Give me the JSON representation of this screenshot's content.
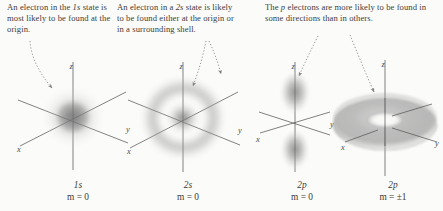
{
  "figure": {
    "background_color": "#fbfbf9",
    "ink_color": "#3a3a3a",
    "cloud_color": "#6b6b6b",
    "axis_color": "#555555",
    "pointer_color": "#8a8a8a"
  },
  "captions": {
    "one_s": {
      "line1": "An electron in the ",
      "emph1": "1s",
      "line2": " state is most likely to be found at the origin.",
      "full": "An electron in the 1s state is most likely to be found at the origin."
    },
    "two_s": {
      "line1": "An electron in a ",
      "emph1": "2s",
      "line2": " state is likely to be found either at the origin or in a surrounding shell.",
      "full": "An electron in a 2s state is likely to be found either at the origin or in a surrounding shell."
    },
    "two_p": {
      "line1": "The ",
      "emph1": "p",
      "line2": " electrons are more likely to be found in some directions than in others.",
      "full": "The p electrons are more likely to be found in some directions than in others."
    }
  },
  "orbitals": [
    {
      "id": "1s",
      "term": "1s",
      "quantum_label": "m = 0",
      "shape": "spherical-cloud",
      "description": "Diffuse spherical probability cloud densest at the origin",
      "axes": [
        "x",
        "y",
        "z"
      ]
    },
    {
      "id": "2s",
      "term": "2s",
      "quantum_label": "m = 0",
      "shape": "shell-with-core",
      "description": "Dense core, radial node, surrounding spherical shell",
      "axes": [
        "x",
        "y",
        "z"
      ]
    },
    {
      "id": "2p-m0",
      "term": "2p",
      "quantum_label": "m = 0",
      "shape": "dumbbell",
      "description": "Two lobes aligned along the z axis with a node at the origin",
      "axes": [
        "x",
        "y",
        "z"
      ]
    },
    {
      "id": "2p-mpm1",
      "term": "2p",
      "quantum_label": "m = ±1",
      "shape": "torus",
      "description": "Doughnut-shaped cloud encircling the z axis",
      "axes": [
        "x",
        "y",
        "z"
      ]
    }
  ],
  "axis_labels": {
    "x": "x",
    "y": "y",
    "z": "z"
  }
}
